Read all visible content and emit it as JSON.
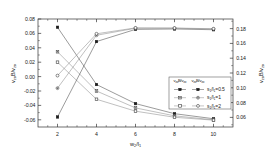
{
  "chart_data": {
    "type": "line",
    "title": "",
    "xlabel": "w2/l1",
    "ylabel_left": "v_zoB/v_zo",
    "ylabel_right": "v_zoB/v_zo",
    "x": [
      2,
      4,
      6,
      8,
      10
    ],
    "xlim": [
      1,
      11
    ],
    "xticks": [
      2,
      4,
      6,
      8,
      10
    ],
    "xticklabels": [
      "2",
      "4",
      "6",
      "8",
      "10"
    ],
    "ylim_left": [
      -0.07,
      0.08
    ],
    "yticks_left": [
      0.08,
      0.06,
      0.04,
      0.02,
      0.0,
      -0.02,
      -0.04,
      -0.06
    ],
    "yticklabels_left": [
      "0.08",
      "0.06",
      "0.04",
      "0.02",
      "0.00",
      "-0.02",
      "-0.04",
      "-0.06"
    ],
    "ylim_right": [
      0.047,
      0.193
    ],
    "yticks_right": [
      0.18,
      0.16,
      0.14,
      0.12,
      0.1,
      0.08,
      0.06
    ],
    "yticklabels_right": [
      "0.18",
      "0.16",
      "0.14",
      "0.12",
      "0.10",
      "0.08",
      "0.06"
    ],
    "grid": false,
    "legend_position": "lower-right",
    "legend_header_left": "v_zoB/v_zo",
    "legend_header_right": "v_zoB/v_zo",
    "series": [
      {
        "name": "s1/l1=0.5",
        "axis": "left",
        "marker": "filled-square",
        "values": [
          0.0685,
          -0.011,
          -0.0375,
          -0.0515,
          -0.0585
        ]
      },
      {
        "name": "s1/l1=1",
        "axis": "left",
        "marker": "half-square",
        "values": [
          0.0345,
          -0.02,
          -0.0435,
          -0.0545,
          -0.06
        ]
      },
      {
        "name": "s1/l1=2",
        "axis": "left",
        "marker": "open-square",
        "values": [
          0.02,
          -0.0315,
          -0.048,
          -0.0565,
          -0.0605
        ]
      },
      {
        "name": "s1/l1=0.5",
        "axis": "right",
        "marker": "filled-square-r",
        "values": [
          0.0605,
          0.1625,
          0.179,
          0.1795,
          0.1785
        ]
      },
      {
        "name": "s1/l1=1",
        "axis": "right",
        "marker": "half-circle",
        "values": [
          0.0995,
          0.171,
          0.1805,
          0.1805,
          0.1795
        ]
      },
      {
        "name": "s1/l1=2",
        "axis": "right",
        "marker": "open-circle",
        "values": [
          0.1165,
          0.173,
          0.181,
          0.1808,
          0.1798
        ]
      }
    ]
  },
  "legend": {
    "rows": [
      {
        "label": "s1/l1=0.5"
      },
      {
        "label": "s1/l1=1"
      },
      {
        "label": "s1/l1=2"
      }
    ]
  },
  "axis_titles": {
    "x_main": "w",
    "x_sub1": "2",
    "x_mid": "/l",
    "x_sub2": "1",
    "y_left_v": "v",
    "y_left_sub": "zo",
    "y_left_b": "B/v",
    "y_left_sub2": "zo",
    "y_right_v": "v",
    "y_right_sub": "zo",
    "y_right_b": "B/v",
    "y_right_sub2": "zo"
  }
}
